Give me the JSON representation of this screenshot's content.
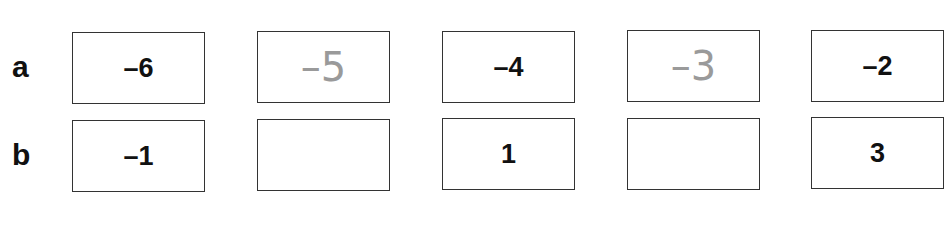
{
  "rows": [
    {
      "label": "a",
      "cells": [
        {
          "value": "–6",
          "style": "printed"
        },
        {
          "value": "–5",
          "style": "handwritten"
        },
        {
          "value": "–4",
          "style": "printed"
        },
        {
          "value": "–3",
          "style": "handwritten"
        },
        {
          "value": "–2",
          "style": "printed"
        }
      ]
    },
    {
      "label": "b",
      "cells": [
        {
          "value": "–1",
          "style": "printed"
        },
        {
          "value": "",
          "style": "empty"
        },
        {
          "value": "1",
          "style": "printed"
        },
        {
          "value": "",
          "style": "empty"
        },
        {
          "value": "3",
          "style": "printed"
        }
      ]
    }
  ]
}
